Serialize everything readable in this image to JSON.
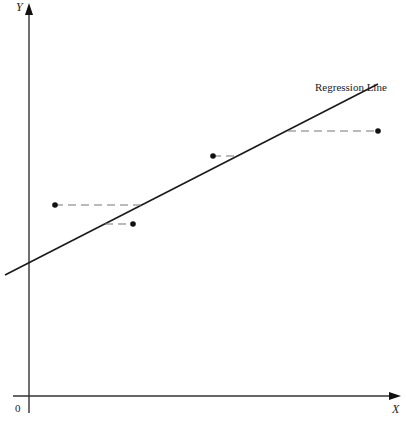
{
  "figure": {
    "y_axis_label": "Y",
    "x_axis_label": "X",
    "origin_label": "0",
    "regression_label": "Regression Line"
  },
  "geometry": {
    "y_axis": {
      "x": 29,
      "y_top": 5,
      "y_bottom": 413
    },
    "x_axis": {
      "y": 396,
      "x_left": 13,
      "x_right": 400
    },
    "regression_line": {
      "x1": 5,
      "y1": 275,
      "x2": 378,
      "y2": 84
    },
    "points": [
      {
        "x": 55,
        "y": 205,
        "line_x": 143
      },
      {
        "x": 133,
        "y": 224,
        "line_x": 105
      },
      {
        "x": 213,
        "y": 156,
        "line_x": 238
      },
      {
        "x": 378,
        "y": 131,
        "line_x": 288
      }
    ]
  },
  "colors": {
    "ink": "#1a1a1a",
    "axis": "#333333",
    "dash": "#777777"
  }
}
